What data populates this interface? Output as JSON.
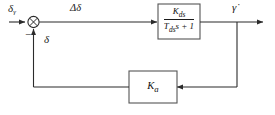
{
  "diagram": {
    "type": "control-block-diagram",
    "signals": {
      "input_label": "δ",
      "input_subscript": "γ",
      "error_label": "Δδ",
      "feedback_label": "δ",
      "output_label": "γ̇",
      "summing_minus_sign": "−"
    },
    "blocks": [
      {
        "name": "plant-transfer-function",
        "numerator": "K",
        "numerator_subscript": "ds",
        "denominator_gain": "T",
        "denominator_subscript": "ds",
        "denominator_rest": "s + 1",
        "expression": "K_ds / (T_ds s + 1)"
      },
      {
        "name": "feedback-gain",
        "label": "K",
        "subscript": "a",
        "expression": "K_a"
      }
    ],
    "junction": {
      "name": "summing-junction",
      "style": "circle-with-cross",
      "inputs": [
        "input-signal",
        "feedback-signal"
      ],
      "signs": [
        "+",
        "−"
      ]
    },
    "colors": {
      "line": "#2b2b2b",
      "block_stroke": "#555555",
      "background": "#ffffff",
      "text": "#1a1a1a"
    }
  }
}
